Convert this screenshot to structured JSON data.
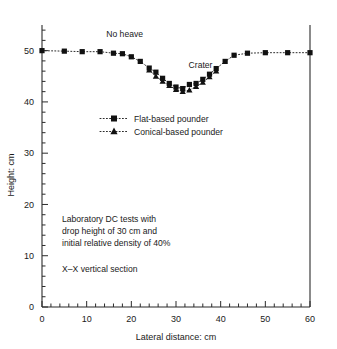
{
  "chart_data": {
    "type": "scatter",
    "title": "",
    "xlabel": "Lateral distance: cm",
    "ylabel": "Height: cm",
    "xlim": [
      0,
      60
    ],
    "ylim": [
      0,
      55
    ],
    "xticks": [
      0,
      10,
      20,
      30,
      40,
      50,
      60
    ],
    "yticks": [
      0,
      10,
      20,
      30,
      40,
      50
    ],
    "xtick_labels": [
      "0",
      "10",
      "20",
      "30",
      "40",
      "50",
      "60"
    ],
    "ytick_labels": [
      "0",
      "10",
      "20",
      "30",
      "40",
      "50"
    ],
    "x_minor_step": 2,
    "y_minor_step": 2,
    "grid": false,
    "legend_position": "center-left",
    "series": [
      {
        "name": "Flat-based pounder",
        "marker": "square",
        "x": [
          0,
          5,
          9,
          13,
          16,
          18,
          20,
          22,
          24,
          25.5,
          27,
          28.5,
          30,
          31.5,
          33,
          34.5,
          36,
          37.5,
          39,
          41,
          43,
          46,
          50,
          55,
          60
        ],
        "y": [
          50.0,
          49.9,
          49.8,
          49.8,
          49.5,
          49.4,
          48.8,
          47.9,
          46.6,
          45.8,
          44.6,
          43.6,
          42.9,
          42.6,
          43.4,
          43.6,
          44.4,
          45.4,
          46.5,
          47.9,
          49.1,
          49.5,
          49.6,
          49.6,
          49.6
        ]
      },
      {
        "name": "Conical-based pounder",
        "marker": "triangle",
        "x": [
          24,
          25.5,
          27,
          28.5,
          30,
          31.5,
          33,
          34.5,
          36,
          37.5,
          39
        ],
        "y": [
          46.2,
          45.0,
          44.0,
          43.2,
          42.4,
          42.0,
          42.3,
          43.0,
          43.8,
          44.9,
          46.0
        ]
      }
    ],
    "annotations": [
      {
        "name": "no-heave",
        "text": "No heave",
        "x": 18.5,
        "y": 52.6
      },
      {
        "name": "crater",
        "text": "Crater",
        "x": 35.5,
        "y": 46.6
      }
    ],
    "notes": {
      "line1": "Laboratory DC tests with",
      "line2": "drop height of 30 cm and",
      "line3": "initial relative density of 40%",
      "line4": "X–X vertical section"
    },
    "colors": {
      "axis": "#2b2b2b",
      "marker": "#111111",
      "background": "#ffffff"
    }
  }
}
